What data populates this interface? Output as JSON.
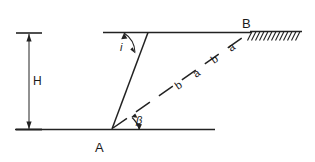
{
  "figure": {
    "type": "diagram",
    "labels": {
      "height": "H",
      "point_a": "A",
      "point_b": "B",
      "angle_slope": "i",
      "angle_beta": "β"
    },
    "segment_labels": [
      {
        "text": "b",
        "id": "seg-b-1"
      },
      {
        "text": "a",
        "id": "seg-a-1"
      },
      {
        "text": "b",
        "id": "seg-b-2"
      },
      {
        "text": "a",
        "id": "seg-a-2"
      }
    ],
    "colors": {
      "ink": "#222222",
      "background": "#ffffff"
    }
  }
}
